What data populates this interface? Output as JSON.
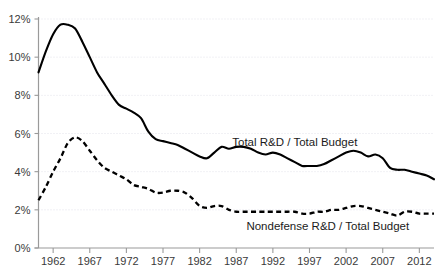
{
  "chart_data": {
    "type": "line",
    "title": "",
    "subtitle": "",
    "xlabel": "",
    "ylabel": "",
    "xlim": [
      1960,
      2014
    ],
    "ylim": [
      0,
      12
    ],
    "grid": true,
    "legend_position": "inline-annotation",
    "y_ticks": [
      0,
      2,
      4,
      6,
      8,
      10,
      12
    ],
    "y_tick_labels": [
      "0%",
      "2%",
      "4%",
      "6%",
      "8%",
      "10%",
      "12%"
    ],
    "x_ticks": [
      1962,
      1967,
      1972,
      1977,
      1982,
      1987,
      1992,
      1997,
      2002,
      2007,
      2012
    ],
    "x_tick_labels": [
      "1962",
      "1967",
      "1972",
      "1977",
      "1982",
      "1987",
      "1992",
      "1997",
      "2002",
      "2007",
      "2012"
    ],
    "x": [
      1960,
      1961,
      1962,
      1963,
      1964,
      1965,
      1966,
      1967,
      1968,
      1969,
      1970,
      1971,
      1972,
      1973,
      1974,
      1975,
      1976,
      1977,
      1978,
      1979,
      1980,
      1981,
      1982,
      1983,
      1984,
      1985,
      1986,
      1987,
      1988,
      1989,
      1990,
      1991,
      1992,
      1993,
      1994,
      1995,
      1996,
      1997,
      1998,
      1999,
      2000,
      2001,
      2002,
      2003,
      2004,
      2005,
      2006,
      2007,
      2008,
      2009,
      2010,
      2011,
      2012,
      2013,
      2014
    ],
    "series": [
      {
        "name": "Total R&D / Total Budget",
        "style": "solid",
        "color": "#000000",
        "annotation": "Total R&D / Total Budget",
        "values": [
          9.2,
          10.3,
          11.2,
          11.7,
          11.7,
          11.5,
          10.8,
          10.0,
          9.2,
          8.6,
          8.0,
          7.5,
          7.3,
          7.1,
          6.8,
          6.1,
          5.7,
          5.6,
          5.5,
          5.4,
          5.2,
          5.0,
          4.8,
          4.7,
          5.0,
          5.3,
          5.2,
          5.3,
          5.3,
          5.2,
          5.0,
          4.9,
          5.0,
          4.9,
          4.7,
          4.5,
          4.3,
          4.3,
          4.3,
          4.4,
          4.6,
          4.8,
          5.0,
          5.1,
          5.0,
          4.8,
          4.9,
          4.7,
          4.2,
          4.1,
          4.1,
          4.0,
          3.9,
          3.8,
          3.6
        ]
      },
      {
        "name": "Nondefense R&D / Total Budget",
        "style": "dashed",
        "color": "#000000",
        "annotation": "Nondefense R&D / Total Budget",
        "values": [
          2.5,
          3.2,
          4.0,
          4.7,
          5.5,
          5.8,
          5.6,
          5.1,
          4.6,
          4.2,
          4.0,
          3.8,
          3.6,
          3.3,
          3.2,
          3.1,
          2.9,
          2.9,
          3.0,
          3.0,
          2.9,
          2.6,
          2.2,
          2.1,
          2.2,
          2.2,
          2.0,
          1.9,
          1.9,
          1.9,
          1.9,
          1.9,
          1.9,
          1.9,
          1.9,
          1.9,
          1.8,
          1.8,
          1.9,
          1.9,
          2.0,
          2.0,
          2.1,
          2.2,
          2.2,
          2.1,
          2.0,
          1.9,
          1.8,
          1.7,
          1.9,
          1.9,
          1.8,
          1.8,
          1.8
        ]
      }
    ]
  },
  "annotations": {
    "total_label": "Total R&D / Total Budget",
    "nondefense_label": "Nondefense R&D / Total Budget"
  }
}
